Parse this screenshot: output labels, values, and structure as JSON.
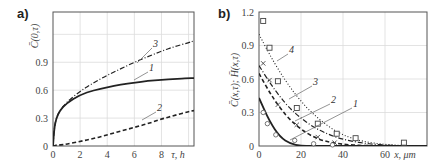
{
  "chart_data": [
    {
      "panel": "a)",
      "type": "line",
      "title": "",
      "xlabel": "τ, h",
      "ylabel": "C̄(0,τ)",
      "xlim": [
        0,
        10.4
      ],
      "ylim": [
        0,
        1.44
      ],
      "xticks": [
        "0",
        "2",
        "4",
        "6",
        "8"
      ],
      "yticks": [
        "0",
        "0.3",
        "0.6",
        "0.9"
      ],
      "grid": true,
      "x": [
        0,
        0.1,
        0.25,
        0.5,
        1,
        2,
        3,
        4,
        5,
        6,
        7,
        8,
        9,
        10,
        10.4
      ],
      "series": [
        {
          "name": "1",
          "style": "solid",
          "values": [
            0,
            0.2,
            0.3,
            0.38,
            0.46,
            0.55,
            0.6,
            0.63,
            0.66,
            0.68,
            0.7,
            0.71,
            0.72,
            0.73,
            0.73
          ]
        },
        {
          "name": "2",
          "style": "dashed",
          "values": [
            0,
            0.0,
            0.01,
            0.01,
            0.02,
            0.05,
            0.08,
            0.12,
            0.16,
            0.2,
            0.24,
            0.29,
            0.33,
            0.37,
            0.38
          ]
        },
        {
          "name": "3",
          "style": "dash-dot",
          "values": [
            0,
            0.2,
            0.3,
            0.38,
            0.47,
            0.59,
            0.68,
            0.76,
            0.83,
            0.9,
            0.96,
            1.02,
            1.07,
            1.11,
            1.13
          ]
        }
      ],
      "annotations": [
        "1",
        "2",
        "3"
      ]
    },
    {
      "panel": "b)",
      "type": "line",
      "title": "",
      "xlabel": "x, μm",
      "ylabel": "C̄(x,τ); H̄(x,τ)",
      "xlim": [
        0,
        80
      ],
      "ylim": [
        0,
        1.2
      ],
      "xticks": [
        "0",
        "20",
        "40",
        "60"
      ],
      "yticks": [
        "0",
        "0.3",
        "0.6",
        "0.9",
        "1.2"
      ],
      "grid": true,
      "x": [
        0,
        5,
        10,
        15,
        20,
        25,
        30,
        35,
        40,
        45,
        50,
        55,
        60,
        65,
        70,
        75,
        80
      ],
      "series": [
        {
          "name": "1",
          "style": "solid",
          "values": [
            0.43,
            0.22,
            0.08,
            0.02,
            0.0,
            0,
            0,
            0,
            0,
            0,
            0,
            0,
            0,
            0,
            0,
            0,
            0
          ]
        },
        {
          "name": "2",
          "style": "dashed",
          "values": [
            0.65,
            0.48,
            0.34,
            0.23,
            0.15,
            0.09,
            0.05,
            0.03,
            0.015,
            0.008,
            0.004,
            0.002,
            0,
            0,
            0,
            0,
            0
          ]
        },
        {
          "name": "3",
          "style": "dash-dot",
          "values": [
            0.72,
            0.57,
            0.44,
            0.33,
            0.25,
            0.18,
            0.13,
            0.09,
            0.06,
            0.04,
            0.025,
            0.015,
            0.008,
            0.004,
            0.002,
            0,
            0
          ]
        },
        {
          "name": "4",
          "style": "dotted",
          "values": [
            1.0,
            0.82,
            0.66,
            0.52,
            0.4,
            0.3,
            0.22,
            0.15,
            0.1,
            0.065,
            0.04,
            0.025,
            0.014,
            0.008,
            0.004,
            0.002,
            0
          ]
        }
      ],
      "markers": {
        "squares": [
          [
            2,
            1.12
          ],
          [
            5,
            0.88
          ],
          [
            9,
            0.58
          ],
          [
            18,
            0.34
          ],
          [
            28,
            0.2
          ],
          [
            37,
            0.11
          ],
          [
            46,
            0.07
          ],
          [
            69,
            0.03
          ]
        ],
        "crosses": [
          [
            2,
            0.74
          ],
          [
            5,
            0.59
          ],
          [
            9,
            0.37
          ],
          [
            18,
            0.19
          ],
          [
            28,
            0.08
          ],
          [
            36,
            0.03
          ]
        ],
        "circles": [
          [
            2,
            0.3
          ],
          [
            4,
            0.2
          ],
          [
            8,
            0.1
          ],
          [
            17,
            0.05
          ],
          [
            26,
            0.02
          ],
          [
            35,
            0.01
          ]
        ]
      },
      "annotations": [
        "1",
        "2",
        "3",
        "4"
      ]
    }
  ],
  "panels": {
    "a": {
      "label": "a)",
      "xlabel": "τ, h",
      "ylabel": "C̄(0,τ)"
    },
    "b": {
      "label": "b)",
      "xlabel": "x, μm",
      "ylabel": "C̄(x,τ); H̄(x,τ)"
    }
  }
}
